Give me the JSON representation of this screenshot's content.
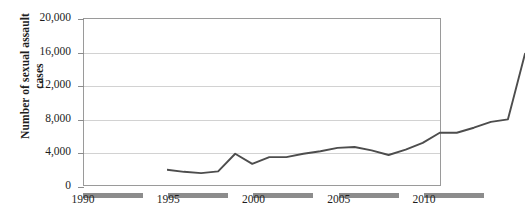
{
  "chart_data": {
    "type": "line",
    "title": "",
    "xlabel": "",
    "ylabel": "Number of sexual assault cases",
    "ylabel_lines": [
      "Number of sexual assault",
      "cases"
    ],
    "xlim": [
      1990,
      2011
    ],
    "ylim": [
      0,
      20000
    ],
    "ytick_values": [
      0,
      4000,
      8000,
      12000,
      16000,
      20000
    ],
    "ytick_labels": [
      "0",
      "4,000",
      "8,000",
      "12,000",
      "16,000",
      "20,000"
    ],
    "xtick_values": [
      1990,
      1995,
      2000,
      2005,
      2010
    ],
    "xtick_labels": [
      "1990",
      "1995",
      "2000",
      "2005",
      "2010"
    ],
    "grid": true,
    "grid_axis": "y",
    "legend": false,
    "series_name": "Number of sexual assault cases",
    "line_color": "#4d4d4d",
    "grid_color": "#d2d2d2",
    "axis_color": "#9a9a9a",
    "x": [
      1990,
      1991,
      1992,
      1993,
      1994,
      1995,
      1996,
      1997,
      1998,
      1999,
      2000,
      2001,
      2002,
      2003,
      2004,
      2005,
      2006,
      2007,
      2008,
      2009,
      2010,
      2011
    ],
    "values": [
      4200,
      3950,
      3800,
      4000,
      6100,
      4900,
      5700,
      5700,
      6100,
      6400,
      6800,
      6900,
      6500,
      5950,
      6600,
      7400,
      8600,
      8600,
      9200,
      9900,
      10200,
      18000
    ]
  }
}
